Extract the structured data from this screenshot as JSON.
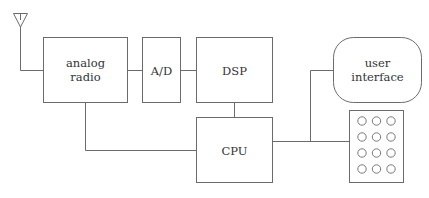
{
  "diagram": {
    "type": "block-diagram",
    "blocks": {
      "analog_radio": {
        "lines": [
          "analog",
          "radio"
        ]
      },
      "ad": {
        "label": "A/D"
      },
      "dsp": {
        "label": "DSP"
      },
      "cpu": {
        "label": "CPU"
      },
      "user_interface": {
        "lines": [
          "user",
          "interface"
        ]
      },
      "keypad": {
        "rows": 4,
        "cols": 3
      }
    },
    "antenna": {
      "icon": "antenna-icon"
    },
    "connections": [
      [
        "antenna",
        "analog_radio"
      ],
      [
        "analog_radio",
        "ad"
      ],
      [
        "ad",
        "dsp"
      ],
      [
        "dsp",
        "cpu"
      ],
      [
        "analog_radio",
        "cpu"
      ],
      [
        "cpu",
        "user_interface"
      ],
      [
        "cpu",
        "keypad"
      ]
    ],
    "colors": {
      "stroke": "#6b6b6b",
      "text": "#333333",
      "background": "#ffffff"
    }
  }
}
